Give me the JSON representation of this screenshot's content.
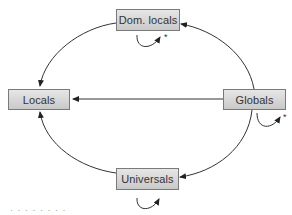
{
  "diagram": {
    "nodes": {
      "dom_locals": {
        "label": "Dom. locals"
      },
      "locals": {
        "label": "Locals"
      },
      "globals": {
        "label": "Globals"
      },
      "universals": {
        "label": "Universals"
      }
    },
    "edges": [
      {
        "from": "Globals",
        "to": "Dom. locals"
      },
      {
        "from": "Dom. locals",
        "to": "Locals"
      },
      {
        "from": "Globals",
        "to": "Locals"
      },
      {
        "from": "Globals",
        "to": "Universals"
      },
      {
        "from": "Universals",
        "to": "Locals"
      },
      {
        "from": "Dom. locals",
        "to": "Dom. locals",
        "note": "*"
      },
      {
        "from": "Globals",
        "to": "Globals",
        "note": "*"
      },
      {
        "from": "Universals",
        "to": "Universals"
      }
    ],
    "self_loop_marks": {
      "dom_locals": "*",
      "globals": "*"
    },
    "caption": "· · · · · · · ·"
  }
}
